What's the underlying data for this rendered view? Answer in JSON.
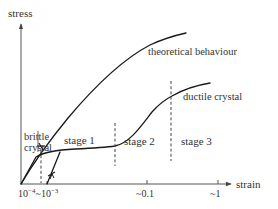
{
  "diagram": {
    "type": "stress-strain schematic",
    "axes": {
      "y_label": "stress",
      "x_label": "strain",
      "x_ticks": [
        {
          "label_base": "10",
          "label_exp": "−4",
          "sep": "~"
        },
        {
          "label_base": "10",
          "label_exp": "−3"
        },
        {
          "label": "~0.1"
        },
        {
          "label": "~1"
        }
      ]
    },
    "curves": {
      "theoretical": {
        "label": "theoretical behaviour"
      },
      "ductile": {
        "label": "ductile crystal"
      },
      "brittle": {
        "label_line1": "brittle",
        "label_line2": "crystal"
      }
    },
    "stages": [
      {
        "label": "stage 1"
      },
      {
        "label": "stage 2"
      },
      {
        "label": "stage 3"
      }
    ],
    "colors": {
      "curve": "#1a1a1a",
      "axis": "#555555",
      "text": "#333333",
      "background": "#ffffff"
    }
  }
}
